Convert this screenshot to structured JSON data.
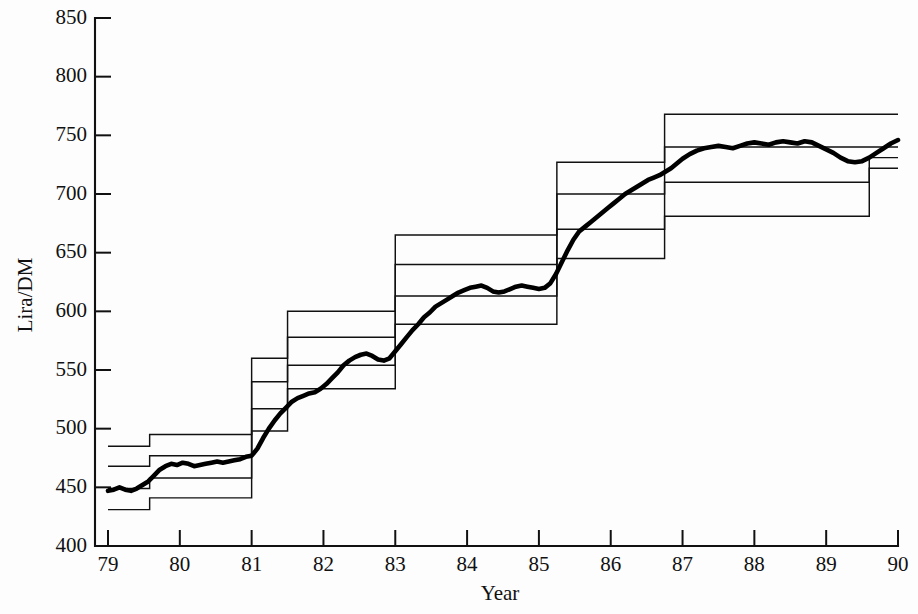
{
  "chart_data": {
    "type": "line",
    "title": "",
    "xlabel": "Year",
    "ylabel": "Lira/DM",
    "xlim": [
      79,
      90
    ],
    "ylim": [
      400,
      850
    ],
    "ytick_step": 50,
    "grid": false,
    "legend": "none",
    "xtick_labels": [
      "79",
      "80",
      "81",
      "82",
      "83",
      "84",
      "85",
      "86",
      "87",
      "88",
      "89",
      "90"
    ],
    "xtick_values": [
      79,
      80,
      81,
      82,
      83,
      84,
      85,
      86,
      87,
      88,
      89,
      90
    ],
    "ytick_labels": [
      "400",
      "450",
      "500",
      "550",
      "600",
      "650",
      "700",
      "750",
      "800",
      "850"
    ],
    "ytick_values": [
      400,
      450,
      500,
      550,
      600,
      650,
      700,
      750,
      800,
      850
    ],
    "series": [
      {
        "name": "wide-band-upper",
        "style": "step",
        "x": [
          79.0,
          79.58,
          79.58,
          81.0,
          81.0,
          81.5,
          81.5,
          83.0,
          83.0,
          85.25,
          85.25,
          86.75,
          86.75,
          90.0
        ],
        "values": [
          485,
          485,
          495,
          495,
          560,
          560,
          600,
          600,
          665,
          665,
          727,
          727,
          768,
          768
        ]
      },
      {
        "name": "narrow-band-upper",
        "style": "step",
        "x": [
          79.0,
          79.58,
          79.58,
          81.0,
          81.0,
          81.5,
          81.5,
          83.0,
          83.0,
          85.25,
          85.25,
          86.75,
          86.75,
          90.0
        ],
        "values": [
          468,
          468,
          477,
          477,
          540,
          540,
          578,
          578,
          640,
          640,
          700,
          700,
          740,
          740
        ]
      },
      {
        "name": "narrow-band-lower",
        "style": "step",
        "x": [
          79.0,
          79.58,
          79.58,
          81.0,
          81.0,
          81.5,
          81.5,
          83.0,
          83.0,
          85.25,
          85.25,
          86.75,
          86.75,
          89.6,
          89.6,
          90.0
        ],
        "values": [
          449,
          449,
          458,
          458,
          517,
          517,
          554,
          554,
          613,
          613,
          670,
          670,
          710,
          710,
          722,
          722
        ]
      },
      {
        "name": "wide-band-lower",
        "style": "step",
        "x": [
          79.0,
          79.58,
          79.58,
          81.0,
          81.0,
          81.5,
          81.5,
          83.0,
          83.0,
          85.25,
          85.25,
          86.75,
          86.75,
          89.6,
          89.6,
          90.0
        ],
        "values": [
          431,
          431,
          441,
          441,
          498,
          498,
          534,
          534,
          589,
          589,
          645,
          645,
          681,
          681,
          731,
          731
        ]
      },
      {
        "name": "lira-dm-exchange-rate",
        "style": "observed",
        "x": [
          79.0,
          79.08,
          79.16,
          79.24,
          79.32,
          79.4,
          79.48,
          79.56,
          79.64,
          79.72,
          79.8,
          79.88,
          79.96,
          80.04,
          80.12,
          80.2,
          80.28,
          80.36,
          80.44,
          80.52,
          80.6,
          80.68,
          80.76,
          80.84,
          80.92,
          81.0,
          81.08,
          81.16,
          81.24,
          81.32,
          81.4,
          81.48,
          81.56,
          81.64,
          81.72,
          81.8,
          81.88,
          81.96,
          82.04,
          82.12,
          82.2,
          82.28,
          82.36,
          82.44,
          82.52,
          82.6,
          82.68,
          82.76,
          82.84,
          82.92,
          83.0,
          83.08,
          83.16,
          83.24,
          83.32,
          83.4,
          83.48,
          83.56,
          83.64,
          83.72,
          83.8,
          83.88,
          83.96,
          84.04,
          84.12,
          84.2,
          84.28,
          84.36,
          84.44,
          84.52,
          84.6,
          84.68,
          84.76,
          84.84,
          84.92,
          85.0,
          85.08,
          85.16,
          85.24,
          85.32,
          85.4,
          85.48,
          85.56,
          85.64,
          85.72,
          85.8,
          85.88,
          85.96,
          86.04,
          86.12,
          86.2,
          86.28,
          86.36,
          86.44,
          86.52,
          86.6,
          86.68,
          86.76,
          86.84,
          86.92,
          87.0,
          87.1,
          87.2,
          87.3,
          87.4,
          87.5,
          87.6,
          87.7,
          87.8,
          87.9,
          88.0,
          88.1,
          88.2,
          88.3,
          88.4,
          88.5,
          88.6,
          88.7,
          88.8,
          88.9,
          89.0,
          89.1,
          89.2,
          89.3,
          89.4,
          89.5,
          89.6,
          89.7,
          89.8,
          89.9,
          90.0
        ],
        "values": [
          447,
          448,
          450,
          448,
          447,
          449,
          452,
          455,
          460,
          465,
          468,
          470,
          469,
          471,
          470,
          468,
          469,
          470,
          471,
          472,
          471,
          472,
          473,
          474,
          476,
          477,
          483,
          492,
          500,
          507,
          513,
          518,
          523,
          526,
          528,
          530,
          531,
          534,
          538,
          543,
          548,
          554,
          558,
          561,
          563,
          564,
          562,
          559,
          558,
          560,
          566,
          572,
          578,
          584,
          589,
          595,
          599,
          604,
          607,
          610,
          613,
          616,
          618,
          620,
          621,
          622,
          620,
          617,
          616,
          617,
          619,
          621,
          622,
          621,
          620,
          619,
          620,
          624,
          632,
          642,
          652,
          661,
          668,
          672,
          676,
          680,
          684,
          688,
          692,
          696,
          700,
          703,
          706,
          709,
          712,
          714,
          716,
          719,
          722,
          726,
          730,
          734,
          737,
          739,
          740,
          741,
          740,
          739,
          741,
          743,
          744,
          743,
          742,
          744,
          745,
          744,
          743,
          745,
          744,
          741,
          738,
          735,
          731,
          728,
          727,
          728,
          731,
          735,
          739,
          743,
          746
        ]
      }
    ]
  },
  "axes": {
    "y_axis_name": "Lira/DM",
    "x_axis_name": "Year"
  },
  "colors": {
    "line": "#111111",
    "rate_line": "#000000",
    "background": "#fdfdfd"
  }
}
